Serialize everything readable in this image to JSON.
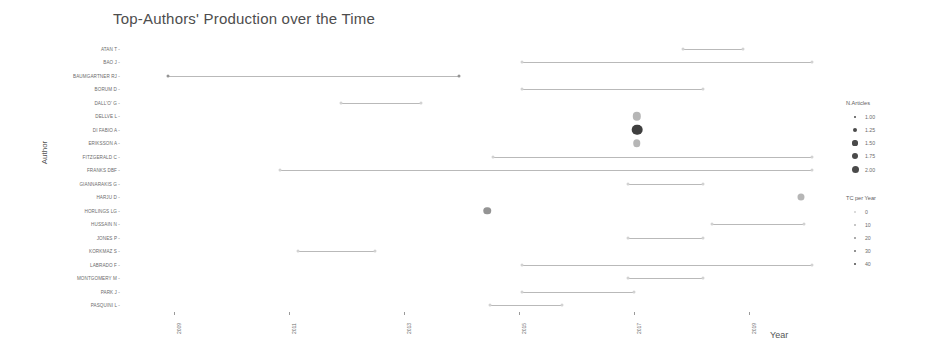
{
  "chart_data": {
    "type": "scatter",
    "title": "Top-Authors' Production over the Time",
    "xlabel": "Year",
    "ylabel": "Author",
    "xlim": [
      2008.2,
      2020.2
    ],
    "xticks": [
      "2009",
      "2011",
      "2013",
      "2015",
      "2017",
      "2019"
    ],
    "xtick_values": [
      2009,
      2011,
      2013,
      2015,
      2017,
      2019
    ],
    "grid": false,
    "legend_position": "right",
    "categories": [
      "ATAN T",
      "BAO J",
      "BAUMGARTNER RJ",
      "BORUM D",
      "DALL'O' G",
      "DELLVE L",
      "DI FABIO A",
      "ERIKSSON A",
      "FITZGERALD C",
      "FRANKS DBF",
      "GIANNARAKIS G",
      "HARJU D",
      "HORLINGS LG",
      "HUSSAIN N",
      "JONES P",
      "KORKMAZ S",
      "LABRADO F",
      "MONTGOMERY M",
      "PARK J",
      "PASQUINI L"
    ],
    "series": [
      {
        "name": "ATAN T",
        "author": "ATAN T",
        "start": 2017.85,
        "end": 2018.9,
        "points": [
          {
            "year": 2017.85,
            "n_articles": 1.0,
            "tc_per_year": 0
          },
          {
            "year": 2018.9,
            "n_articles": 1.0,
            "tc_per_year": 0
          }
        ]
      },
      {
        "name": "BAO J",
        "author": "BAO J",
        "start": 2015.05,
        "end": 2020.1,
        "points": [
          {
            "year": 2015.05,
            "n_articles": 1.0,
            "tc_per_year": 0
          },
          {
            "year": 2020.1,
            "n_articles": 1.0,
            "tc_per_year": 0
          }
        ]
      },
      {
        "name": "BAUMGARTNER RJ",
        "author": "BAUMGARTNER RJ",
        "start": 2008.9,
        "end": 2013.95,
        "points": [
          {
            "year": 2008.9,
            "n_articles": 1.0,
            "tc_per_year": 20
          },
          {
            "year": 2013.95,
            "n_articles": 1.0,
            "tc_per_year": 20
          }
        ]
      },
      {
        "name": "BORUM D",
        "author": "BORUM D",
        "start": 2015.05,
        "end": 2018.2,
        "points": [
          {
            "year": 2015.05,
            "n_articles": 1.0,
            "tc_per_year": 0
          },
          {
            "year": 2018.2,
            "n_articles": 1.0,
            "tc_per_year": 0
          }
        ]
      },
      {
        "name": "DALL'O' G",
        "author": "DALL'O' G",
        "start": 2011.9,
        "end": 2013.3,
        "points": [
          {
            "year": 2011.9,
            "n_articles": 1.0,
            "tc_per_year": 0
          },
          {
            "year": 2013.3,
            "n_articles": 1.0,
            "tc_per_year": 0
          }
        ]
      },
      {
        "name": "DELLVE L",
        "author": "DELLVE L",
        "start": 2017.05,
        "end": 2017.05,
        "points": [
          {
            "year": 2017.05,
            "n_articles": 1.6,
            "tc_per_year": 12
          }
        ]
      },
      {
        "name": "DI FABIO A",
        "author": "DI FABIO A",
        "start": 2017.05,
        "end": 2017.05,
        "points": [
          {
            "year": 2017.05,
            "n_articles": 1.85,
            "tc_per_year": 40
          }
        ]
      },
      {
        "name": "ERIKSSON A",
        "author": "ERIKSSON A",
        "start": 2017.05,
        "end": 2017.05,
        "points": [
          {
            "year": 2017.05,
            "n_articles": 1.5,
            "tc_per_year": 12
          }
        ]
      },
      {
        "name": "FITZGERALD C",
        "author": "FITZGERALD C",
        "start": 2014.55,
        "end": 2020.1,
        "points": [
          {
            "year": 2014.55,
            "n_articles": 1.0,
            "tc_per_year": 0
          },
          {
            "year": 2020.1,
            "n_articles": 1.0,
            "tc_per_year": 0
          }
        ]
      },
      {
        "name": "FRANKS DBF",
        "author": "FRANKS DBF",
        "start": 2010.85,
        "end": 2020.1,
        "points": [
          {
            "year": 2010.85,
            "n_articles": 1.0,
            "tc_per_year": 0
          },
          {
            "year": 2020.1,
            "n_articles": 1.0,
            "tc_per_year": 0
          }
        ]
      },
      {
        "name": "GIANNARAKIS G",
        "author": "GIANNARAKIS G",
        "start": 2016.9,
        "end": 2018.2,
        "points": [
          {
            "year": 2016.9,
            "n_articles": 1.0,
            "tc_per_year": 0
          },
          {
            "year": 2018.2,
            "n_articles": 1.0,
            "tc_per_year": 0
          }
        ]
      },
      {
        "name": "HARJU D",
        "author": "HARJU D",
        "start": 2019.9,
        "end": 2019.9,
        "points": [
          {
            "year": 2019.9,
            "n_articles": 1.45,
            "tc_per_year": 10
          }
        ]
      },
      {
        "name": "HORLINGS LG",
        "author": "HORLINGS LG",
        "start": 2014.45,
        "end": 2014.45,
        "points": [
          {
            "year": 2014.45,
            "n_articles": 1.5,
            "tc_per_year": 16
          }
        ]
      },
      {
        "name": "HUSSAIN N",
        "author": "HUSSAIN N",
        "start": 2018.35,
        "end": 2019.95,
        "points": [
          {
            "year": 2018.35,
            "n_articles": 1.0,
            "tc_per_year": 0
          },
          {
            "year": 2019.95,
            "n_articles": 1.0,
            "tc_per_year": 0
          }
        ]
      },
      {
        "name": "JONES P",
        "author": "JONES P",
        "start": 2016.9,
        "end": 2018.2,
        "points": [
          {
            "year": 2016.9,
            "n_articles": 1.0,
            "tc_per_year": 0
          },
          {
            "year": 2018.2,
            "n_articles": 1.0,
            "tc_per_year": 0
          }
        ]
      },
      {
        "name": "KORKMAZ S",
        "author": "KORKMAZ S",
        "start": 2011.15,
        "end": 2012.5,
        "points": [
          {
            "year": 2011.15,
            "n_articles": 1.0,
            "tc_per_year": 0
          },
          {
            "year": 2012.5,
            "n_articles": 1.0,
            "tc_per_year": 0
          }
        ]
      },
      {
        "name": "LABRADO F",
        "author": "LABRADO F",
        "start": 2015.05,
        "end": 2020.1,
        "points": [
          {
            "year": 2015.05,
            "n_articles": 1.0,
            "tc_per_year": 0
          },
          {
            "year": 2020.1,
            "n_articles": 1.0,
            "tc_per_year": 0
          }
        ]
      },
      {
        "name": "MONTGOMERY M",
        "author": "MONTGOMERY M",
        "start": 2016.9,
        "end": 2018.2,
        "points": [
          {
            "year": 2016.9,
            "n_articles": 1.0,
            "tc_per_year": 0
          },
          {
            "year": 2018.2,
            "n_articles": 1.0,
            "tc_per_year": 0
          }
        ]
      },
      {
        "name": "PARK J",
        "author": "PARK J",
        "start": 2015.05,
        "end": 2017.0,
        "points": [
          {
            "year": 2015.05,
            "n_articles": 1.0,
            "tc_per_year": 0
          },
          {
            "year": 2017.0,
            "n_articles": 1.0,
            "tc_per_year": 0
          }
        ]
      },
      {
        "name": "PASQUINI L",
        "author": "PASQUINI L",
        "start": 2014.5,
        "end": 2015.75,
        "points": [
          {
            "year": 2014.5,
            "n_articles": 1.0,
            "tc_per_year": 0
          },
          {
            "year": 2015.75,
            "n_articles": 1.0,
            "tc_per_year": 0
          }
        ]
      }
    ],
    "legends": [
      {
        "title": "N.Articles",
        "entries": [
          {
            "label": "1.00",
            "size": 2.4
          },
          {
            "label": "1.25",
            "size": 4.2
          },
          {
            "label": "1.50",
            "size": 5.2
          },
          {
            "label": "1.75",
            "size": 6.0
          },
          {
            "label": "2.00",
            "size": 7.0
          }
        ]
      },
      {
        "title": "TC per Year",
        "entries": [
          {
            "label": "0",
            "color": "#cfcfcf"
          },
          {
            "label": "10",
            "color": "#b4b4b4"
          },
          {
            "label": "20",
            "color": "#8f8f8f"
          },
          {
            "label": "30",
            "color": "#6e6e6e"
          },
          {
            "label": "40",
            "color": "#4a4a4a"
          }
        ]
      }
    ]
  }
}
